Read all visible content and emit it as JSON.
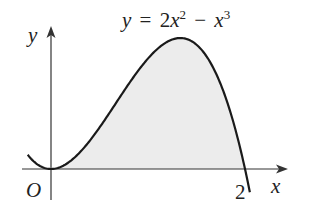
{
  "chart_data": {
    "type": "area",
    "equation": {
      "lhs": "y",
      "eq": "=",
      "coef": "2",
      "term1_var": "x",
      "term1_exp": "2",
      "minus": "−",
      "term2_var": "x",
      "term2_exp": "3"
    },
    "xlabel": "x",
    "ylabel": "y",
    "origin_label": "O",
    "x_tick_labels": [
      "2"
    ],
    "x_ticks": [
      2
    ],
    "function": "2*x^2 - x^3",
    "x_range_drawn": [
      -0.24,
      2.05
    ],
    "shaded_region": {
      "from": 0,
      "to": 2,
      "color": "#ececec"
    },
    "key_points": [
      {
        "x": 0,
        "y": 0,
        "label": "O"
      },
      {
        "x": 1.333,
        "y": 1.185,
        "label": "maximum"
      },
      {
        "x": 2,
        "y": 0,
        "label": "2"
      }
    ],
    "grid": false,
    "colors": {
      "curve": "#1a1a1a",
      "axes": "#333333",
      "fill": "#ececec"
    }
  }
}
